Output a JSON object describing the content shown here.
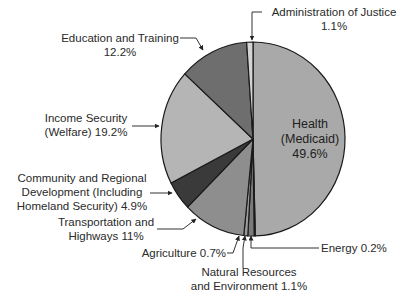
{
  "chart_data": {
    "type": "pie",
    "title": "",
    "start_angle_deg": 0,
    "direction": "clockwise",
    "slices": [
      {
        "label": "Health (Medicaid)",
        "value": 49.6,
        "display": "49.6%",
        "color": "#a9a9a9"
      },
      {
        "label": "Energy",
        "value": 0.2,
        "display": "0.2%",
        "color": "#8c8c8c"
      },
      {
        "label": "Natural Resources and Environment",
        "value": 1.1,
        "display": "1.1%",
        "color": "#7a7a7a"
      },
      {
        "label": "Agriculture",
        "value": 0.7,
        "display": "0.7%",
        "color": "#9a9a9a"
      },
      {
        "label": "Transportation and Highways",
        "value": 11,
        "display": "11%",
        "color": "#8e8e8e"
      },
      {
        "label": "Community and Regional Development (Including Homeland Security)",
        "value": 4.9,
        "display": "4.9%",
        "color": "#3a3a3a"
      },
      {
        "label": "Income Security (Welfare)",
        "value": 19.2,
        "display": "19.2%",
        "color": "#b5b5b5"
      },
      {
        "label": "Education and Training",
        "value": 12.2,
        "display": "12.2%",
        "color": "#6e6e6e"
      },
      {
        "label": "Administration of Justice",
        "value": 1.1,
        "display": "1.1%",
        "color": "#d4d4d4"
      }
    ],
    "legend": "callout labels with arrows"
  },
  "labels": {
    "health": [
      "Health",
      "(Medicaid)",
      "49.6%"
    ],
    "admin_justice": [
      "Administration of Justice",
      "1.1%"
    ],
    "education": [
      "Education and Training",
      "12.2%"
    ],
    "income": [
      "Income Security",
      "(Welfare) 19.2%"
    ],
    "community": [
      "Community and Regional",
      "Development (Including",
      "Homeland Security) 4.9%"
    ],
    "transport": [
      "Transportation and",
      "Highways 11%"
    ],
    "agriculture": "Agriculture 0.7%",
    "natural": [
      "Natural Resources",
      "and Environment 1.1%"
    ],
    "energy": "Energy 0.2%"
  }
}
